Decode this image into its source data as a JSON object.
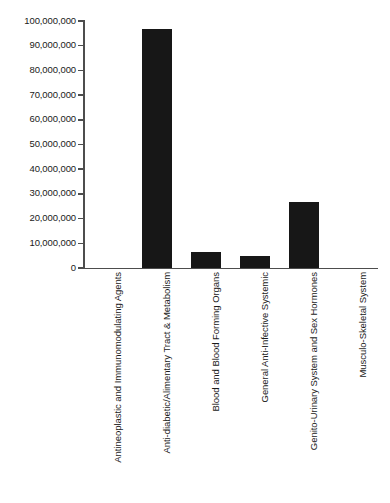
{
  "chart_data": {
    "type": "bar",
    "title": "",
    "subtitle": "",
    "xlabel": "",
    "ylabel": "",
    "categories": [
      "Antineoplastic and Immunomodulating Agents",
      "Anti-diabetic/Alimentary Tract & Metabolism",
      "Blood and Blood Forming Organs",
      "General Anti-Infective Systemic",
      "Genito-Urinary System and Sex Hormones",
      "Musculo-Skeletal System"
    ],
    "values": [
      0,
      96800000,
      6500000,
      4900000,
      26700000,
      0
    ],
    "ylim": [
      0,
      100000000
    ],
    "ytick_values": [
      0,
      10000000,
      20000000,
      30000000,
      40000000,
      50000000,
      60000000,
      70000000,
      80000000,
      90000000,
      100000000
    ],
    "ytick_labels": [
      "0",
      "10,000,000",
      "20,000,000",
      "30,000,000",
      "40,000,000",
      "50,000,000",
      "60,000,000",
      "70,000,000",
      "80,000,000",
      "90,000,000",
      "100,000,000"
    ],
    "grid": false,
    "legend": null,
    "legend_position": "none",
    "bar_color": "#171717",
    "axis_color": "#4d4d4d",
    "text_color": "#1a1a1a",
    "background_color": "#ffffff"
  }
}
